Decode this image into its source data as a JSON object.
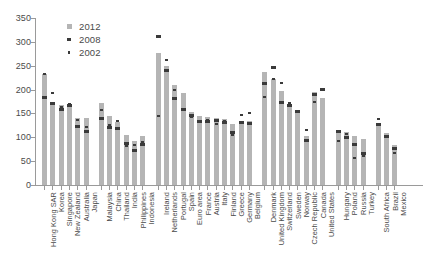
{
  "chart_data": {
    "type": "bar",
    "title": "",
    "xlabel": "",
    "ylabel": "",
    "ylim": [
      0,
      350
    ],
    "yticks": [
      0,
      50,
      100,
      150,
      200,
      250,
      300,
      350
    ],
    "grid": false,
    "legend_position": "top-left",
    "legend": [
      {
        "label": "2012",
        "marker": "square",
        "color": "#b5b5b5"
      },
      {
        "label": "2008",
        "marker": "dot-medium",
        "color": "#3a3a3a"
      },
      {
        "label": "2002",
        "marker": "dot-small",
        "color": "#3a3a3a"
      }
    ],
    "series": [
      {
        "name": "2012",
        "type": "bar"
      },
      {
        "name": "2008",
        "type": "point"
      },
      {
        "name": "2002",
        "type": "point"
      }
    ],
    "categories": [
      "Hong Kong SAR",
      "Korea",
      "Singapore",
      "New Zealand",
      "Australia",
      "Japan",
      "Malaysia",
      "China",
      "Thailand",
      "India",
      "Philippines",
      "Indonesia",
      "Ireland",
      "Netherlands",
      "Portugal",
      "Spain",
      "Euro area",
      "France",
      "Austria",
      "Italy",
      "Finland",
      "Greece",
      "Germany",
      "Belgium",
      "Denmark",
      "United Kingdom",
      "Switzerland",
      "Sweden",
      "Norway",
      "Czech Republic",
      "Canada",
      "United States",
      "Hungary",
      "Poland",
      "Russia",
      "Turkey",
      "South Africa",
      "Brazil",
      "Mexico"
    ],
    "groups": [
      {
        "name": "Advanced Asia",
        "start": 0,
        "count": 6
      },
      {
        "name": "Emerging Asia",
        "start": 6,
        "count": 6
      },
      {
        "name": "Euro area",
        "start": 12,
        "count": 12
      },
      {
        "name": "Other advanced Europe and North America",
        "start": 24,
        "count": 8
      },
      {
        "name": "Emerging Europe",
        "start": 32,
        "count": 4
      },
      {
        "name": "Other emerging",
        "start": 36,
        "count": 3
      }
    ],
    "values_2012": [
      233,
      175,
      168,
      167,
      140,
      140,
      171,
      145,
      133,
      104,
      92,
      103,
      277,
      249,
      209,
      193,
      152,
      145,
      143,
      141,
      138,
      127,
      128,
      134,
      237,
      222,
      197,
      170,
      157,
      103,
      195,
      183,
      116,
      112,
      103,
      97,
      126,
      110,
      83
    ],
    "values_2008": [
      184,
      171,
      159,
      167,
      122,
      112,
      140,
      120,
      118,
      88,
      73,
      85,
      312,
      241,
      182,
      159,
      146,
      134,
      133,
      135,
      131,
      111,
      130,
      129,
      213,
      247,
      173,
      166,
      153,
      93,
      190,
      200,
      112,
      99,
      84,
      67,
      127,
      102,
      77
    ],
    "values_2002": [
      233,
      192,
      163,
      169,
      137,
      122,
      157,
      125,
      135,
      81,
      84,
      91,
      145,
      262,
      200,
      157,
      143,
      135,
      137,
      127,
      134,
      105,
      146,
      150,
      184,
      223,
      213,
      172,
      156,
      116,
      175,
      200,
      93,
      106,
      57,
      60,
      138,
      100,
      68
    ]
  }
}
